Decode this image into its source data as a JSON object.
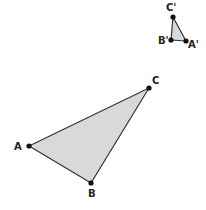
{
  "diagram": {
    "fill_color": "#d9d9d9",
    "stroke_color": "#333333",
    "point_color": "#111111",
    "triangles": [
      {
        "name": "ABC",
        "points": [
          {
            "label": "A",
            "x": 29,
            "y": 146,
            "lx": 14,
            "ly": 150
          },
          {
            "label": "B",
            "x": 91,
            "y": 183,
            "lx": 88,
            "ly": 197
          },
          {
            "label": "C",
            "x": 149,
            "y": 88,
            "lx": 152,
            "ly": 84
          }
        ]
      },
      {
        "name": "A'B'C'",
        "points": [
          {
            "label": "A'",
            "x": 186,
            "y": 41,
            "lx": 188,
            "ly": 48
          },
          {
            "label": "B'",
            "x": 171,
            "y": 40,
            "lx": 158,
            "ly": 44
          },
          {
            "label": "C'",
            "x": 173,
            "y": 17,
            "lx": 166,
            "ly": 11
          }
        ]
      }
    ]
  }
}
